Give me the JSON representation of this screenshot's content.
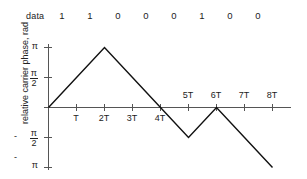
{
  "data_row": {
    "label": "data",
    "bits": [
      "1",
      "1",
      "0",
      "0",
      "0",
      "1",
      "0",
      "0"
    ]
  },
  "axes": {
    "ylabel": "relative carrier phase, rad",
    "ytick_labels": [
      {
        "text": "π",
        "kind": "plain",
        "value": 3.1416
      },
      {
        "text": "π/2",
        "num": "π",
        "den": "2",
        "kind": "fraction",
        "value": 1.5708
      },
      {
        "text": "-π/2",
        "num": "π",
        "den": "2",
        "kind": "fraction",
        "sign": "-",
        "value": -1.5708
      },
      {
        "text": "-π",
        "kind": "plain",
        "sign": "-",
        "value": -3.1416
      }
    ],
    "xtick_labels": [
      "T",
      "2T",
      "3T",
      "4T",
      "5T",
      "6T",
      "7T",
      "8T"
    ],
    "axis_color": "#555555",
    "trace_color": "#111111"
  },
  "chart_data": {
    "type": "line",
    "title": "",
    "xlabel": "",
    "ylabel": "relative carrier phase, rad",
    "xlim": [
      0,
      8.7
    ],
    "ylim": [
      -3.1416,
      3.1416
    ],
    "grid": false,
    "legend": null,
    "xtick_values": [
      0,
      1,
      2,
      3,
      4,
      5,
      6,
      7,
      8
    ],
    "xtick_labels": [
      "",
      "T",
      "2T",
      "3T",
      "4T",
      "5T",
      "6T",
      "7T",
      "8T"
    ],
    "ytick_values": [
      3.1416,
      1.5708,
      -1.5708,
      -3.1416
    ],
    "ytick_labels": [
      "π",
      "π/2",
      "-π/2",
      "-π"
    ],
    "series": [
      {
        "name": "relative carrier phase",
        "x": [
          0,
          1,
          2,
          3,
          4,
          5,
          6,
          7,
          8
        ],
        "y": [
          0,
          1.5708,
          3.1416,
          1.5708,
          0,
          -1.5708,
          0,
          -1.5708,
          -3.1416
        ]
      }
    ],
    "annotations": {
      "data_bits_label": "data",
      "data_bits": [
        "1",
        "1",
        "0",
        "0",
        "0",
        "1",
        "0",
        "0"
      ]
    }
  }
}
